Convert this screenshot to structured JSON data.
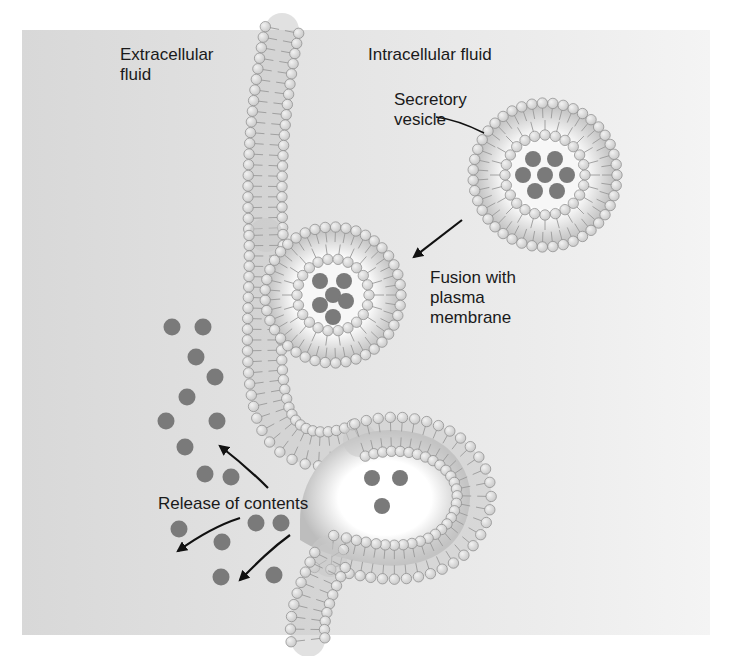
{
  "diagram": {
    "labels": {
      "extracellular": "Extracellular\nfluid",
      "intracellular": "Intracellular fluid",
      "secretory_vesicle": "Secretory\nvesicle",
      "fusion": "Fusion with\nplasma\nmembrane",
      "release": "Release of contents"
    },
    "colors": {
      "background_left": "#d8d8d8",
      "background_right": "#f4f4f4",
      "lipid_head": "#c8c8c8",
      "lipid_head_stroke": "#8a8a8a",
      "lipid_tail": "#9a9a9a",
      "content_particle": "#7a7a7a",
      "arrow": "#111111"
    },
    "free_vesicle": {
      "cx": 545,
      "cy": 175,
      "outer_r": 72,
      "inner_r": 40,
      "particles": 7
    },
    "fused_vesicle": {
      "cx": 333,
      "cy": 295,
      "outer_r": 68,
      "inner_r": 36,
      "particles": 6
    },
    "released_particles": [
      [
        172,
        327
      ],
      [
        203,
        327
      ],
      [
        196,
        357
      ],
      [
        215,
        377
      ],
      [
        187,
        397
      ],
      [
        166,
        421
      ],
      [
        217,
        421
      ],
      [
        185,
        447
      ],
      [
        205,
        474
      ],
      [
        231,
        477
      ],
      [
        179,
        529
      ],
      [
        222,
        542
      ],
      [
        256,
        523
      ],
      [
        281,
        523
      ],
      [
        221,
        577
      ],
      [
        274,
        575
      ]
    ]
  }
}
